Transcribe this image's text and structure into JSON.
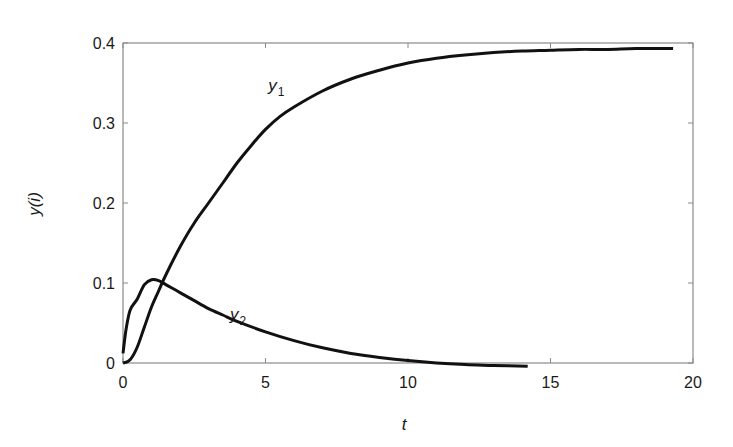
{
  "chart_data": {
    "type": "line",
    "title": "",
    "xlabel": "t",
    "ylabel": "y(i)",
    "xlim": [
      0,
      20
    ],
    "ylim": [
      0,
      0.4
    ],
    "x_ticks": [
      0,
      5,
      10,
      15,
      20
    ],
    "x_tick_labels": [
      "0",
      "5",
      "10",
      "15",
      "20"
    ],
    "y_ticks": [
      0,
      0.1,
      0.2,
      0.3,
      0.4
    ],
    "y_tick_labels": [
      "0",
      "0.1",
      "0.2",
      "0.3",
      "0.4"
    ],
    "grid": false,
    "legend": "inline curve labels",
    "series": [
      {
        "name": "y1",
        "label_base": "y",
        "label_sub": "1",
        "label_pos": [
          5.1,
          0.34
        ],
        "color": "#111111",
        "x": [
          0,
          0.25,
          0.5,
          0.75,
          1.0,
          1.25,
          1.5,
          2.0,
          2.5,
          3.0,
          3.5,
          4.0,
          4.5,
          5.0,
          5.5,
          6.0,
          7.0,
          8.0,
          9.0,
          10.0,
          11.0,
          12.0,
          13.0,
          14.0,
          15.0,
          16.0,
          17.0,
          18.0,
          19.3
        ],
        "y": [
          0,
          0.004,
          0.02,
          0.045,
          0.07,
          0.09,
          0.11,
          0.145,
          0.175,
          0.2,
          0.225,
          0.25,
          0.272,
          0.292,
          0.308,
          0.32,
          0.34,
          0.355,
          0.366,
          0.375,
          0.381,
          0.385,
          0.388,
          0.39,
          0.391,
          0.392,
          0.392,
          0.393,
          0.393
        ]
      },
      {
        "name": "y2",
        "label_base": "y",
        "label_sub": "2",
        "label_pos": [
          3.75,
          0.054
        ],
        "color": "#111111",
        "x": [
          0,
          0.1,
          0.25,
          0.5,
          0.75,
          1.0,
          1.25,
          1.5,
          2.0,
          2.5,
          3.0,
          3.5,
          4.0,
          5.0,
          6.0,
          7.0,
          8.0,
          9.0,
          10.0,
          11.0,
          12.0,
          13.0,
          14.2
        ],
        "y": [
          0.012,
          0.04,
          0.066,
          0.08,
          0.098,
          0.104,
          0.103,
          0.098,
          0.088,
          0.078,
          0.068,
          0.06,
          0.052,
          0.039,
          0.028,
          0.019,
          0.012,
          0.007,
          0.003,
          0.0,
          -0.002,
          -0.003,
          -0.004
        ]
      }
    ]
  }
}
